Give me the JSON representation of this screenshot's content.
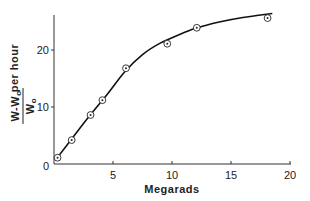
{
  "chart_data": {
    "type": "line",
    "title": "",
    "xlabel": "Megarads",
    "ylabel": {
      "numerator": "W-W",
      "numerator_sub": "o",
      "denominator": "W",
      "denominator_sub": "o",
      "suffix": "per hour"
    },
    "xlim": [
      0,
      20
    ],
    "ylim": [
      0,
      27
    ],
    "xticks": [
      0,
      5,
      10,
      15,
      20
    ],
    "xtick_labels": [
      "",
      "5",
      "10",
      "15",
      "20"
    ],
    "yticks": [
      0,
      10,
      20
    ],
    "ytick_labels": [
      "0",
      "10",
      "20"
    ],
    "grid": false,
    "series": [
      {
        "name": "measured",
        "marker": "circle-dot",
        "x": [
          0.3,
          1.5,
          3.1,
          4.1,
          6.1,
          9.6,
          12.1,
          18.1
        ],
        "y": [
          1.1,
          4.2,
          8.6,
          11.2,
          16.8,
          21.1,
          23.9,
          25.6
        ]
      },
      {
        "name": "fitted-curve",
        "marker": "none",
        "x": [
          0.2,
          1.5,
          3.0,
          4.5,
          6.0,
          7.5,
          9.0,
          10.5,
          12.0,
          14.0,
          16.0,
          18.5
        ],
        "y": [
          0.9,
          4.4,
          8.4,
          12.2,
          16.2,
          19.2,
          21.2,
          22.6,
          23.8,
          24.9,
          25.7,
          26.4
        ]
      }
    ]
  }
}
